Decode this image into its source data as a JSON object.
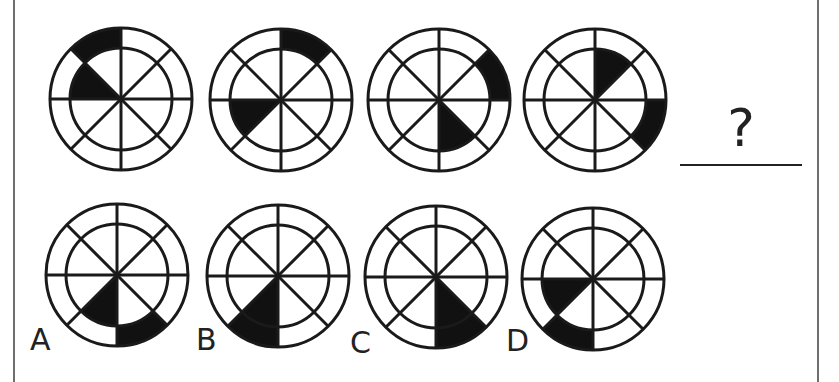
{
  "puzzle": {
    "sector_convention": "sectors indexed 0-7 clockwise from 12 o'clock, each 45 degrees",
    "question_mark": "?",
    "sequence": [
      {
        "cx": 121,
        "cy": 99,
        "outer_shaded": [
          7
        ],
        "inner_shaded": [
          6
        ]
      },
      {
        "cx": 281,
        "cy": 100,
        "outer_shaded": [
          0
        ],
        "inner_shaded": [
          5
        ]
      },
      {
        "cx": 439,
        "cy": 100,
        "outer_shaded": [
          1
        ],
        "inner_shaded": [
          3
        ]
      },
      {
        "cx": 595,
        "cy": 100,
        "outer_shaded": [
          2
        ],
        "inner_shaded": [
          0
        ]
      }
    ],
    "options": [
      {
        "label": "A",
        "cx": 117,
        "cy": 275,
        "outer_shaded": [
          3
        ],
        "inner_shaded": [
          4
        ],
        "label_x": 30,
        "label_y": 325
      },
      {
        "label": "B",
        "cx": 278,
        "cy": 276,
        "outer_shaded": [
          4
        ],
        "inner_shaded": [
          4
        ],
        "label_x": 196,
        "label_y": 325
      },
      {
        "label": "C",
        "cx": 436,
        "cy": 277,
        "outer_shaded": [
          3
        ],
        "inner_shaded": [
          3
        ],
        "label_x": 350,
        "label_y": 328
      },
      {
        "label": "D",
        "cx": 593,
        "cy": 279,
        "outer_shaded": [
          4
        ],
        "inner_shaded": [
          5
        ],
        "label_x": 506,
        "label_y": 326
      }
    ],
    "outer_radius": 71,
    "inner_radius": 51,
    "fill_color": "#111111",
    "stroke_color": "#1a1a1a"
  },
  "labels": {
    "A": "A",
    "B": "B",
    "C": "C",
    "D": "D"
  }
}
